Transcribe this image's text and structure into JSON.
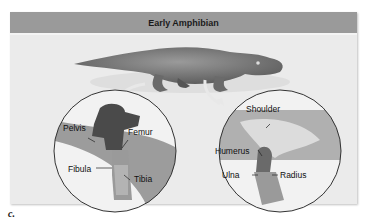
{
  "figure": {
    "title": "Early Amphibian",
    "caption": "c.",
    "hindlimb_inset": {
      "labels": [
        "Pelvis",
        "Femur",
        "Fibula",
        "Tibia"
      ]
    },
    "forelimb_inset": {
      "labels": [
        "Shoulder",
        "Humerus",
        "Ulna",
        "Radius"
      ]
    },
    "colors": {
      "header_bg": "#9a9a9a",
      "panel_bg": "#ebebeb",
      "body": "#6f6f6f",
      "bone_dark": "#4a4a4a",
      "bone_light": "#d8d8d8"
    }
  }
}
